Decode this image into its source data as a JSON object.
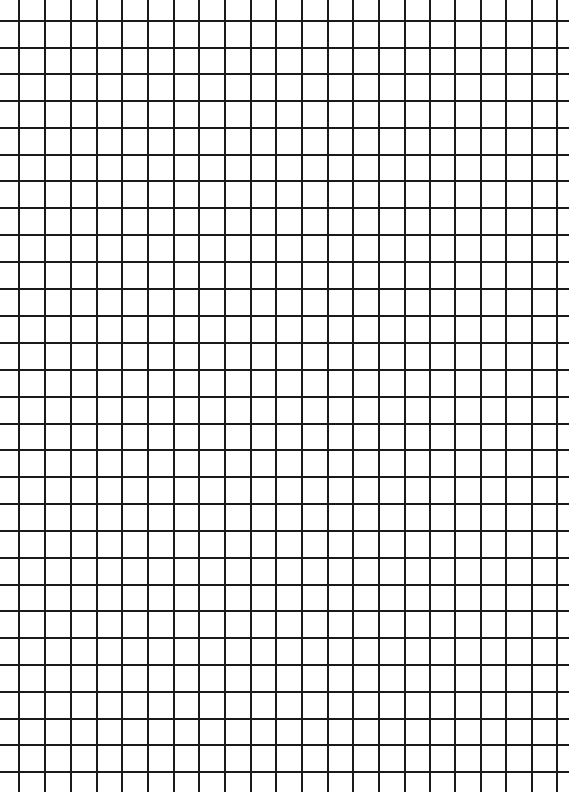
{
  "sheet": {
    "type": "grid-paper",
    "width": 569,
    "height": 792,
    "background_color": "#ffffff",
    "line_color": "#1a1a1a",
    "vertical_lines_x": [
      18,
      44,
      70,
      96,
      121,
      147,
      173,
      198,
      224,
      250,
      275,
      301,
      327,
      352,
      378,
      404,
      429,
      454,
      480,
      505,
      531,
      556
    ],
    "horizontal_lines_y": [
      20,
      47,
      73,
      100,
      127,
      154,
      180,
      207,
      234,
      261,
      288,
      315,
      342,
      369,
      396,
      423,
      449,
      476,
      503,
      530,
      557,
      584,
      610,
      637,
      664,
      691,
      718,
      744,
      771
    ]
  }
}
